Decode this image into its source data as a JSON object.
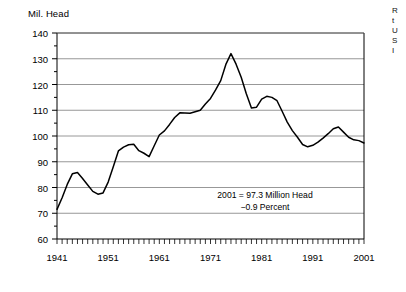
{
  "chart_data": {
    "type": "line",
    "title": "",
    "ylabel": "Mil. Head",
    "xlabel": "",
    "ylim": [
      60,
      140
    ],
    "xlim": [
      1941,
      2001
    ],
    "ytick_step": 10,
    "yminor_step": 5,
    "grid": true,
    "legend": null,
    "xticks_major": [
      "1941",
      "1951",
      "1961",
      "1971",
      "1981",
      "1991",
      "2001"
    ],
    "xtick_minor_every": 1,
    "annotations": [
      "2001 = 97.3 Million Head",
      "−0.9 Percent"
    ],
    "series": [
      {
        "name": "Cattle and Calves Inventory",
        "x": [
          1941,
          1942,
          1943,
          1944,
          1945,
          1946,
          1947,
          1948,
          1949,
          1950,
          1951,
          1952,
          1953,
          1954,
          1955,
          1956,
          1957,
          1958,
          1959,
          1960,
          1961,
          1962,
          1963,
          1964,
          1965,
          1966,
          1967,
          1968,
          1969,
          1970,
          1971,
          1972,
          1973,
          1974,
          1975,
          1976,
          1977,
          1978,
          1979,
          1980,
          1981,
          1982,
          1983,
          1984,
          1985,
          1986,
          1987,
          1988,
          1989,
          1990,
          1991,
          1992,
          1993,
          1994,
          1995,
          1996,
          1997,
          1998,
          1999,
          2000,
          2001
        ],
        "values": [
          71.5,
          76.0,
          81.2,
          85.3,
          85.8,
          83.5,
          81.0,
          78.5,
          77.4,
          77.9,
          82.1,
          88.1,
          94.2,
          95.7,
          96.6,
          96.8,
          94.3,
          93.3,
          92.0,
          96.2,
          100.4,
          102.0,
          104.5,
          107.2,
          109.0,
          108.9,
          108.8,
          109.4,
          110.0,
          112.4,
          114.6,
          117.9,
          121.5,
          127.8,
          132.0,
          127.9,
          122.8,
          116.4,
          110.9,
          111.2,
          114.3,
          115.4,
          115.0,
          113.7,
          109.6,
          105.4,
          102.1,
          99.5,
          96.7,
          95.8,
          96.4,
          97.6,
          99.2,
          100.9,
          102.8,
          103.5,
          101.5,
          99.5,
          98.5,
          98.2,
          97.3
        ]
      }
    ]
  },
  "side_note": {
    "lines": [
      "R",
      "t",
      "U",
      "S",
      "I"
    ]
  }
}
